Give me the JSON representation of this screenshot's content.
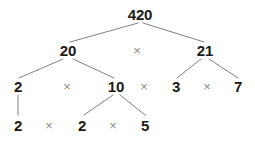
{
  "diagram": {
    "type": "factor-tree",
    "background_color": "#ffffff",
    "number_color": "#1a1a1a",
    "operator_color": "#8c8c8c",
    "edge_color": "#808080",
    "operator_symbol": "×",
    "rows": [
      {
        "row_index": 0,
        "nodes": [
          {
            "id": "n420",
            "label": "420",
            "kind": "number",
            "x": 140,
            "y": 14
          }
        ]
      },
      {
        "row_index": 1,
        "nodes": [
          {
            "id": "n20",
            "label": "20",
            "kind": "number",
            "x": 68,
            "y": 50
          },
          {
            "id": "op1",
            "label": "×",
            "kind": "operator",
            "x": 137,
            "y": 50
          },
          {
            "id": "n21",
            "label": "21",
            "kind": "number",
            "x": 205,
            "y": 50
          }
        ]
      },
      {
        "row_index": 2,
        "nodes": [
          {
            "id": "n2a",
            "label": "2",
            "kind": "number",
            "x": 18,
            "y": 86
          },
          {
            "id": "op2",
            "label": "×",
            "kind": "operator",
            "x": 67,
            "y": 86
          },
          {
            "id": "n10",
            "label": "10",
            "kind": "number",
            "x": 116,
            "y": 86
          },
          {
            "id": "op3",
            "label": "×",
            "kind": "operator",
            "x": 144,
            "y": 86
          },
          {
            "id": "n3",
            "label": "3",
            "kind": "number",
            "x": 176,
            "y": 86
          },
          {
            "id": "op4",
            "label": "×",
            "kind": "operator",
            "x": 207,
            "y": 86
          },
          {
            "id": "n7",
            "label": "7",
            "kind": "number",
            "x": 238,
            "y": 86
          }
        ]
      },
      {
        "row_index": 3,
        "nodes": [
          {
            "id": "n2b",
            "label": "2",
            "kind": "number",
            "x": 18,
            "y": 125
          },
          {
            "id": "op5",
            "label": "×",
            "kind": "operator",
            "x": 49,
            "y": 125
          },
          {
            "id": "n2c",
            "label": "2",
            "kind": "number",
            "x": 82,
            "y": 125
          },
          {
            "id": "op6",
            "label": "×",
            "kind": "operator",
            "x": 113,
            "y": 125
          },
          {
            "id": "n5",
            "label": "5",
            "kind": "number",
            "x": 145,
            "y": 125
          }
        ]
      }
    ],
    "edges": [
      {
        "from": "n420",
        "to": "n20",
        "x1": 138,
        "y1": 23,
        "x2": 70,
        "y2": 42
      },
      {
        "from": "n420",
        "to": "n21",
        "x1": 143,
        "y1": 23,
        "x2": 204,
        "y2": 42
      },
      {
        "from": "n20",
        "to": "n2a",
        "x1": 63,
        "y1": 59,
        "x2": 19,
        "y2": 78
      },
      {
        "from": "n20",
        "to": "n10",
        "x1": 73,
        "y1": 59,
        "x2": 114,
        "y2": 78
      },
      {
        "from": "n21",
        "to": "n3",
        "x1": 201,
        "y1": 59,
        "x2": 177,
        "y2": 78
      },
      {
        "from": "n21",
        "to": "n7",
        "x1": 209,
        "y1": 59,
        "x2": 238,
        "y2": 78
      },
      {
        "from": "n10",
        "to": "n2c",
        "x1": 113,
        "y1": 95,
        "x2": 84,
        "y2": 115
      },
      {
        "from": "n10",
        "to": "n5",
        "x1": 120,
        "y1": 95,
        "x2": 145,
        "y2": 115
      },
      {
        "from": "n2a",
        "to": "n2b",
        "x1": 18,
        "y1": 95,
        "x2": 18,
        "y2": 115
      }
    ],
    "factorization": {
      "composite": 420,
      "prime_factors": [
        2,
        2,
        3,
        5,
        7
      ],
      "intermediate_factors": [
        20,
        21,
        10
      ]
    }
  }
}
